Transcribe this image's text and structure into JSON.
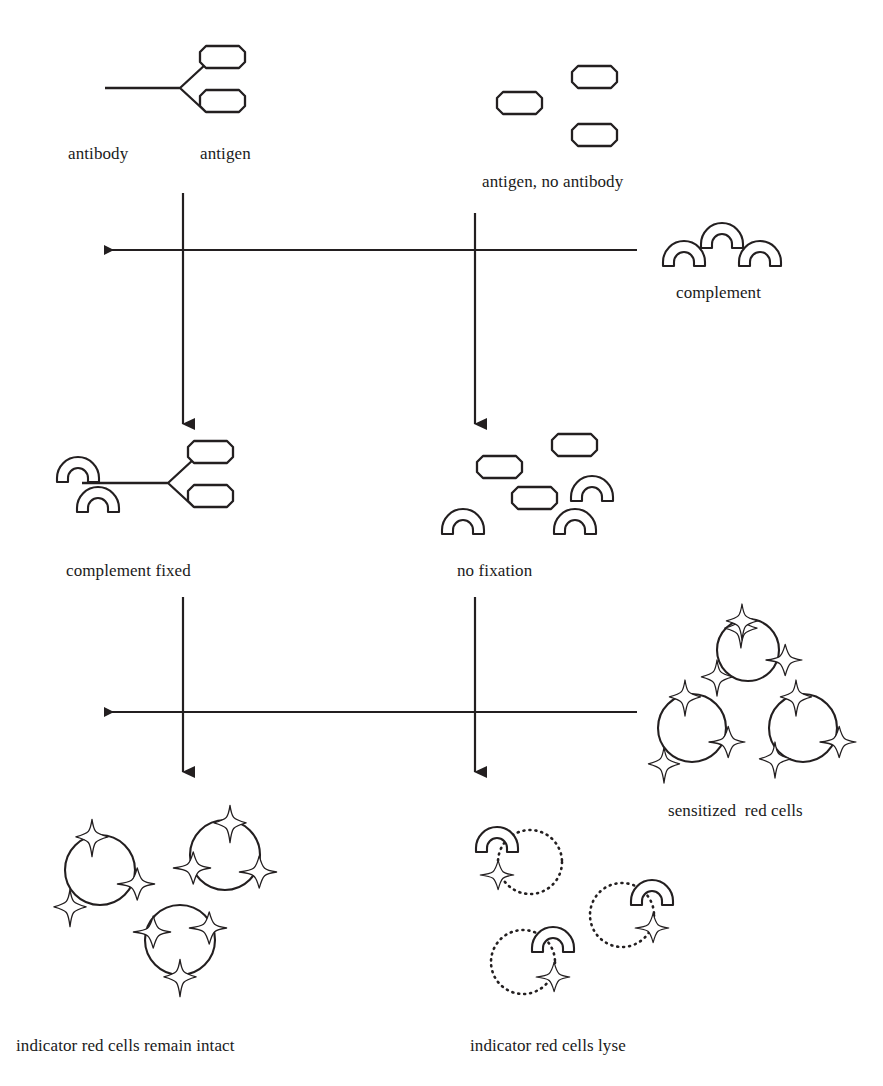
{
  "diagram": {
    "stroke_color": "#231f20",
    "background_color": "#ffffff",
    "labels": [
      {
        "id": "antibody",
        "text": "antibody",
        "x": 68,
        "y": 144
      },
      {
        "id": "antigen",
        "text": "antigen",
        "x": 200,
        "y": 144
      },
      {
        "id": "antigen-no-antibody",
        "text": "antigen, no antibody",
        "x": 482,
        "y": 172
      },
      {
        "id": "complement",
        "text": "complement",
        "x": 676,
        "y": 283
      },
      {
        "id": "complement-fixed",
        "text": "complement fixed",
        "x": 66,
        "y": 561
      },
      {
        "id": "no-fixation",
        "text": "no fixation",
        "x": 457,
        "y": 561
      },
      {
        "id": "sensitized-red-cells",
        "text": "sensitized  red cells",
        "x": 668,
        "y": 801
      },
      {
        "id": "intact-cells",
        "text": "indicator red cells remain intact",
        "x": 16,
        "y": 1036
      },
      {
        "id": "lysed-cells",
        "text": "indicator red cells lyse",
        "x": 470,
        "y": 1036
      }
    ],
    "flow": {
      "left_column_x": 183,
      "right_column_x": 475,
      "horizontal_arrows": [
        {
          "id": "complement-added",
          "y": 250,
          "from_x": 637,
          "to_x": 95,
          "direction": "left"
        },
        {
          "id": "indicator-cells-added",
          "y": 712,
          "from_x": 637,
          "to_x": 95,
          "direction": "left"
        }
      ],
      "vertical_arrows": [
        {
          "id": "antibody-antigen-down",
          "x": 183,
          "from_y": 193,
          "to_y": 435,
          "direction": "down"
        },
        {
          "id": "antigen-only-down",
          "x": 475,
          "from_y": 213,
          "to_y": 435,
          "direction": "down"
        },
        {
          "id": "fixed-down",
          "x": 183,
          "from_y": 597,
          "to_y": 783,
          "direction": "down"
        },
        {
          "id": "no-fixation-down",
          "x": 475,
          "from_y": 597,
          "to_y": 783,
          "direction": "down"
        }
      ]
    },
    "shapes": {
      "antibody_top": {
        "tail_x": 105,
        "fork_x": 180,
        "y": 88,
        "arm_dx": 26,
        "arm_dy": 24
      },
      "antibody_fixed": {
        "tail_x": 120,
        "fork_x": 168,
        "y": 483,
        "arm_dx": 26,
        "arm_dy": 24
      },
      "antigens_top_right": [
        {
          "x": 497,
          "y": 92
        },
        {
          "x": 572,
          "y": 77
        },
        {
          "x": 572,
          "y": 135
        }
      ],
      "antigens_no_fixation": [
        {
          "x": 487,
          "y": 466
        },
        {
          "x": 557,
          "y": 444
        },
        {
          "x": 522,
          "y": 495
        }
      ],
      "complement_legend": [
        {
          "x": 671,
          "y": 264
        },
        {
          "x": 709,
          "y": 248
        },
        {
          "x": 747,
          "y": 264
        }
      ],
      "complement_fixed_pair": [
        {
          "x": 58,
          "y": 481
        },
        {
          "x": 78,
          "y": 503
        }
      ],
      "complement_no_fixation": [
        {
          "x": 450,
          "y": 533
        },
        {
          "x": 560,
          "y": 533
        },
        {
          "x": 575,
          "y": 500
        }
      ],
      "sensitized_cells": [
        {
          "cx": 745,
          "cy": 645,
          "r": 30
        },
        {
          "cx": 690,
          "cy": 725,
          "r": 35
        },
        {
          "cx": 800,
          "cy": 725,
          "r": 35
        }
      ],
      "intact_cells": [
        {
          "cx": 98,
          "cy": 868,
          "r": 35
        },
        {
          "cx": 222,
          "cy": 858,
          "r": 35
        },
        {
          "cx": 178,
          "cy": 938,
          "r": 35
        }
      ],
      "lysed_cells": [
        {
          "cx": 527,
          "cy": 862,
          "r": 30
        },
        {
          "cx": 620,
          "cy": 915,
          "r": 30
        },
        {
          "cx": 530,
          "cy": 960,
          "r": 30
        }
      ]
    }
  }
}
